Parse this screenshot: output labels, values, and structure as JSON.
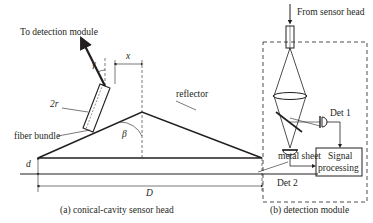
{
  "panel_a": {
    "caption": "(a) conical-cavity sensor head",
    "labels": {
      "to_detection": "To detection module",
      "gamma": "γ",
      "x": "x",
      "two_r": "2r",
      "reflector": "reflector",
      "fiber_bundle": "fiber bundle",
      "beta": "β",
      "metal_sheet": "metal sheet",
      "d": "d",
      "D": "D"
    }
  },
  "panel_b": {
    "caption": "(b) detection module",
    "labels": {
      "from_sensor": "From sensor head",
      "det1": "Det 1",
      "det2": "Det 2",
      "signal_processing_line1": "Signal",
      "signal_processing_line2": "processing"
    }
  },
  "colors": {
    "stroke": "#231f20",
    "background": "#ffffff"
  }
}
